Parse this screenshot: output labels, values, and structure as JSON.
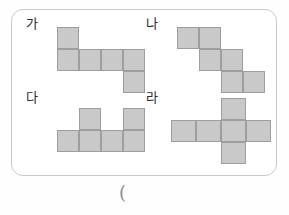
{
  "page": {
    "background_color": "#fefefe",
    "card_border_color": "#c9c9c9",
    "cell_fill_color": "#c9c9c9",
    "cell_border_color": "#9e9e9e",
    "label_color": "#2c2c2c"
  },
  "footer": {
    "paren_text": "("
  },
  "figures": [
    {
      "id": "ga",
      "label": "가",
      "description": "Z-shaped hexomino net",
      "cols": 4,
      "rows": 3,
      "cells": [
        [
          1,
          0,
          0,
          0
        ],
        [
          1,
          1,
          1,
          1
        ],
        [
          0,
          0,
          0,
          1
        ]
      ]
    },
    {
      "id": "na",
      "label": "나",
      "description": "Staircase hexomino net",
      "cols": 4,
      "rows": 3,
      "cells": [
        [
          1,
          1,
          0,
          0
        ],
        [
          0,
          1,
          1,
          0
        ],
        [
          0,
          0,
          1,
          1
        ]
      ]
    },
    {
      "id": "da",
      "label": "다",
      "description": "Row of four with two tabs on top",
      "cols": 4,
      "rows": 2,
      "cells": [
        [
          0,
          1,
          0,
          1
        ],
        [
          1,
          1,
          1,
          1
        ]
      ]
    },
    {
      "id": "ra",
      "label": "라",
      "description": "Cross-shaped hexomino net",
      "cols": 4,
      "rows": 3,
      "cells": [
        [
          0,
          0,
          1,
          0
        ],
        [
          1,
          1,
          1,
          1
        ],
        [
          0,
          0,
          1,
          0
        ]
      ]
    }
  ]
}
